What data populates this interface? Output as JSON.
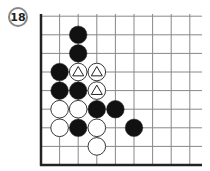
{
  "diagram": {
    "label": "18",
    "board": {
      "origin_x": 41,
      "bottom_y": 165,
      "spacing": 18.6,
      "columns": 9,
      "rows": 9,
      "edges": [
        "left",
        "bottom"
      ],
      "line_color": "#888888",
      "edge_color": "#222222"
    },
    "stones": [
      {
        "color": "black",
        "col": 2,
        "row": 7
      },
      {
        "color": "black",
        "col": 2,
        "row": 6
      },
      {
        "color": "black",
        "col": 1,
        "row": 5
      },
      {
        "color": "white",
        "col": 2,
        "row": 5,
        "mark": "triangle"
      },
      {
        "color": "white",
        "col": 3,
        "row": 5,
        "mark": "triangle"
      },
      {
        "color": "black",
        "col": 1,
        "row": 4
      },
      {
        "color": "black",
        "col": 2,
        "row": 4
      },
      {
        "color": "white",
        "col": 3,
        "row": 4,
        "mark": "triangle"
      },
      {
        "color": "white",
        "col": 1,
        "row": 3
      },
      {
        "color": "white",
        "col": 2,
        "row": 3
      },
      {
        "color": "black",
        "col": 3,
        "row": 3
      },
      {
        "color": "black",
        "col": 4,
        "row": 3
      },
      {
        "color": "white",
        "col": 1,
        "row": 2
      },
      {
        "color": "black",
        "col": 2,
        "row": 2
      },
      {
        "color": "white",
        "col": 3,
        "row": 2
      },
      {
        "color": "black",
        "col": 5,
        "row": 2
      },
      {
        "color": "white",
        "col": 3,
        "row": 1
      }
    ]
  }
}
